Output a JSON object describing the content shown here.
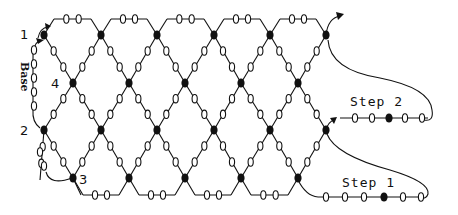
{
  "diagram": {
    "type": "crochet-lattice-chart",
    "labels": {
      "point_1": "1",
      "point_2": "2",
      "point_3": "3",
      "point_4": "4",
      "base": "Base",
      "step_1": "Step 1",
      "step_2": "Step 2"
    },
    "symbols": {
      "chain_stitch": "open-oval",
      "single_crochet": "filled-dot",
      "direction": "arrow"
    },
    "colors": {
      "ink": "#111111",
      "background": "#ffffff"
    },
    "lattice": {
      "top_chain_y": 19,
      "row_y": [
        35,
        83,
        130,
        178
      ],
      "bottom_chain_y": 195,
      "even_row_dot_x": [
        44,
        101,
        157,
        214,
        270,
        326
      ],
      "odd_row_dot_x": [
        73,
        129,
        185,
        241,
        298
      ]
    },
    "step_2_chain": {
      "y": 118,
      "ovals_x": [
        355,
        372,
        405,
        422
      ],
      "dot_x": 389
    },
    "step_1_chain": {
      "y": 197,
      "ovals_x": [
        326,
        345,
        364,
        403,
        421
      ],
      "dot_x": 384
    }
  }
}
